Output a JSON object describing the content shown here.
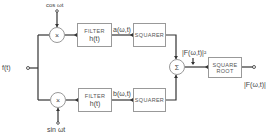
{
  "diagram": {
    "input_label": "f(t)",
    "top_carrier": "cos ωt",
    "bottom_carrier": "sin ωt",
    "multiplier_symbol": "×",
    "sum_symbol": "Σ",
    "top_filter": {
      "title": "FILTER",
      "sub": "h(t)"
    },
    "bottom_filter": {
      "title": "FILTER",
      "sub": "h(t)"
    },
    "top_signal": "a(ω,t)",
    "bottom_signal": "b(ω,t)",
    "top_squarer": "SQUARER",
    "bottom_squarer": "SQUARER",
    "sum_output_label": "|F(ω,t)|²",
    "sqrt_box": {
      "line1": "SQUARE",
      "line2": "ROOT"
    },
    "output_label": "|F(ω,t)|"
  }
}
